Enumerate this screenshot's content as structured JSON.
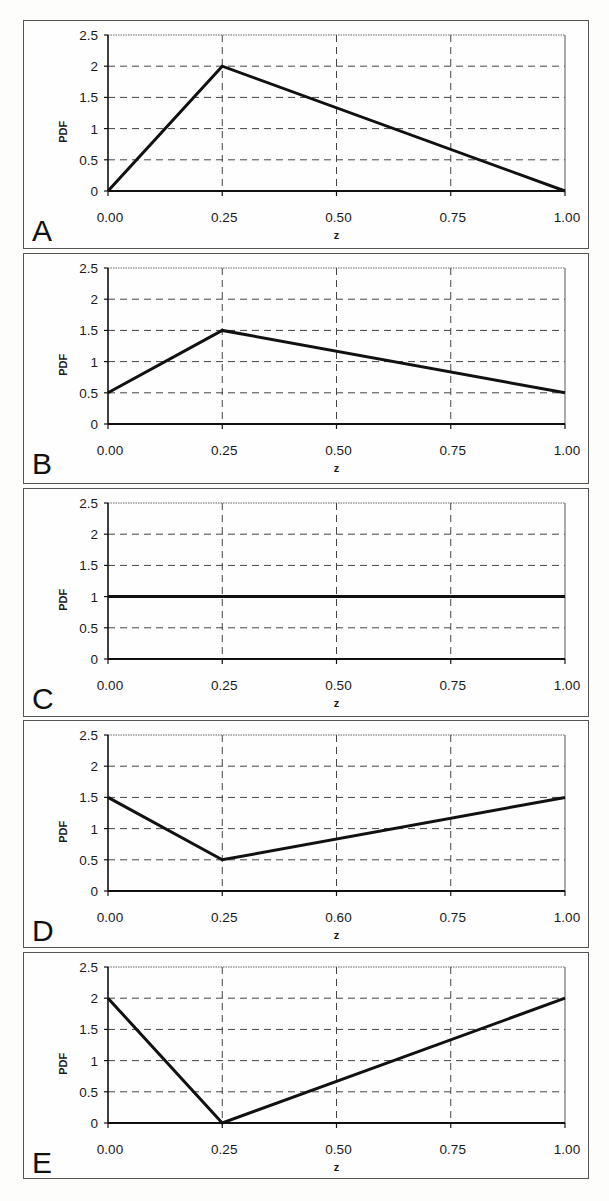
{
  "figure": {
    "panel_labels": [
      "A",
      "B",
      "C",
      "D",
      "E"
    ],
    "ylabel": "PDF",
    "xlabel": "z",
    "yticks": [
      "0",
      "0.5",
      "1",
      "1.5",
      "2",
      "2.5"
    ],
    "xticks_default": [
      "0.00",
      "0.25",
      "0.50",
      "0.75",
      "1.00"
    ],
    "xticks_panel_D": [
      "0.00",
      "0.25",
      "0.60",
      "0.75",
      "1.00"
    ],
    "line_color": "#111111",
    "grid_color": "#444444"
  },
  "chart_data": [
    {
      "type": "line",
      "panel": "A",
      "title": "",
      "xlabel": "z",
      "ylabel": "PDF",
      "x": [
        0.0,
        0.25,
        1.0
      ],
      "y": [
        0.0,
        2.0,
        0.0
      ],
      "xlim": [
        0,
        1
      ],
      "ylim": [
        0,
        2.5
      ],
      "xticks": [
        "0.00",
        "0.25",
        "0.50",
        "0.75",
        "1.00"
      ],
      "yticks": [
        "0",
        "0.5",
        "1",
        "1.5",
        "2",
        "2.5"
      ],
      "grid": "dashed"
    },
    {
      "type": "line",
      "panel": "B",
      "title": "",
      "xlabel": "z",
      "ylabel": "PDF",
      "x": [
        0.0,
        0.25,
        1.0
      ],
      "y": [
        0.5,
        1.5,
        0.5
      ],
      "xlim": [
        0,
        1
      ],
      "ylim": [
        0,
        2.5
      ],
      "xticks": [
        "0.00",
        "0.25",
        "0.50",
        "0.75",
        "1.00"
      ],
      "yticks": [
        "0",
        "0.5",
        "1",
        "1.5",
        "2",
        "2.5"
      ],
      "grid": "dashed"
    },
    {
      "type": "line",
      "panel": "C",
      "title": "",
      "xlabel": "z",
      "ylabel": "PDF",
      "x": [
        0.0,
        1.0
      ],
      "y": [
        1.0,
        1.0
      ],
      "xlim": [
        0,
        1
      ],
      "ylim": [
        0,
        2.5
      ],
      "xticks": [
        "0.00",
        "0.25",
        "0.50",
        "0.75",
        "1.00"
      ],
      "yticks": [
        "0",
        "0.5",
        "1",
        "1.5",
        "2",
        "2.5"
      ],
      "grid": "dashed"
    },
    {
      "type": "line",
      "panel": "D",
      "title": "",
      "xlabel": "z",
      "ylabel": "PDF",
      "x": [
        0.0,
        0.25,
        1.0
      ],
      "y": [
        1.5,
        0.5,
        1.5
      ],
      "xlim": [
        0,
        1
      ],
      "ylim": [
        0,
        2.5
      ],
      "xticks": [
        "0.00",
        "0.25",
        "0.60",
        "0.75",
        "1.00"
      ],
      "yticks": [
        "0",
        "0.5",
        "1",
        "1.5",
        "2",
        "2.5"
      ],
      "grid": "dashed"
    },
    {
      "type": "line",
      "panel": "E",
      "title": "",
      "xlabel": "z",
      "ylabel": "PDF",
      "x": [
        0.0,
        0.25,
        1.0
      ],
      "y": [
        2.0,
        0.0,
        2.0
      ],
      "xlim": [
        0,
        1
      ],
      "ylim": [
        0,
        2.5
      ],
      "xticks": [
        "0.00",
        "0.25",
        "0.50",
        "0.75",
        "1.00"
      ],
      "yticks": [
        "0",
        "0.5",
        "1",
        "1.5",
        "2",
        "2.5"
      ],
      "grid": "dashed"
    }
  ]
}
